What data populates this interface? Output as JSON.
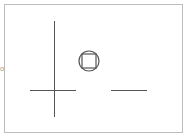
{
  "canvas": {
    "background": "#ffffff",
    "frame": {
      "x": 4,
      "y": 4,
      "w": 178,
      "h": 128,
      "stroke": "#bdbdbd"
    },
    "stroke_color": "#555555"
  },
  "shapes": {
    "vertical_line": {
      "x1": 54,
      "y1": 21,
      "x2": 54,
      "y2": 117
    },
    "left_horizontal_line": {
      "x1": 30,
      "y1": 90,
      "x2": 76,
      "y2": 90
    },
    "right_horizontal_line": {
      "x1": 111,
      "y1": 90,
      "x2": 147,
      "y2": 90
    },
    "circle": {
      "cx": 89,
      "cy": 61,
      "r": 10
    },
    "square": {
      "x": 82,
      "y": 54,
      "w": 14,
      "h": 14
    }
  },
  "side_marker": {
    "label": "o"
  }
}
